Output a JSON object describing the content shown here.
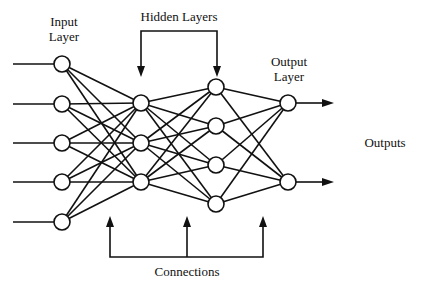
{
  "diagram": {
    "labels": {
      "input_layer_line1": "Input",
      "input_layer_line2": "Layer",
      "hidden_layers": "Hidden Layers",
      "output_layer_line1": "Output",
      "output_layer_line2": "Layer",
      "outputs": "Outputs",
      "connections": "Connections"
    },
    "layers": [
      {
        "name": "input",
        "node_count": 5,
        "x": 62,
        "ys": [
          64,
          104,
          143,
          182,
          222
        ]
      },
      {
        "name": "hidden1",
        "node_count": 3,
        "x": 141,
        "ys": [
          103,
          143,
          182
        ]
      },
      {
        "name": "hidden2",
        "node_count": 4,
        "x": 216,
        "ys": [
          87,
          126,
          165,
          204
        ]
      },
      {
        "name": "output",
        "node_count": 2,
        "x": 288,
        "ys": [
          103,
          182
        ]
      }
    ],
    "node_radius": 8,
    "fully_connected": true,
    "colors": {
      "stroke": "#111111",
      "background": "#ffffff"
    }
  }
}
